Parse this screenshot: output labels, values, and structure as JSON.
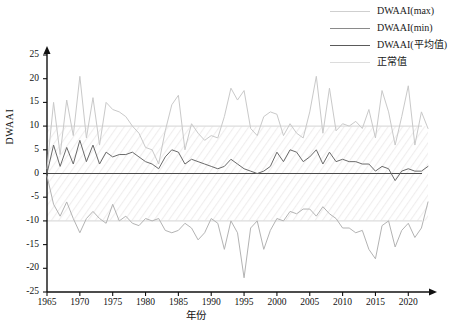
{
  "chart_data": {
    "type": "line",
    "title": "",
    "xlabel": "年份",
    "ylabel": "DWAAI",
    "xlim": [
      1965,
      2023
    ],
    "ylim": [
      -25,
      25
    ],
    "yticks": [
      25,
      20,
      15,
      10,
      5,
      0,
      -5,
      -10,
      -15,
      -20,
      -25
    ],
    "xticks": [
      1965,
      1970,
      1975,
      1980,
      1985,
      1990,
      1995,
      2000,
      2005,
      2010,
      2015,
      2020
    ],
    "grid": false,
    "legend_position": "top-right",
    "reference_lines": [
      {
        "label": "正常值",
        "value": 10,
        "color": "#dcdcdc"
      },
      {
        "label": "正常值",
        "value": -10,
        "color": "#dcdcdc"
      }
    ],
    "x": [
      1965,
      1966,
      1967,
      1968,
      1969,
      1970,
      1971,
      1972,
      1973,
      1974,
      1975,
      1976,
      1977,
      1978,
      1979,
      1980,
      1981,
      1982,
      1983,
      1984,
      1985,
      1986,
      1987,
      1988,
      1989,
      1990,
      1991,
      1992,
      1993,
      1994,
      1995,
      1996,
      1997,
      1998,
      1999,
      2000,
      2001,
      2002,
      2003,
      2004,
      2005,
      2006,
      2007,
      2008,
      2009,
      2010,
      2011,
      2012,
      2013,
      2014,
      2015,
      2016,
      2017,
      2018,
      2019,
      2020,
      2021,
      2022,
      2023
    ],
    "series": [
      {
        "name": "DWAAI(max)",
        "color": "#c9c9c9",
        "values": [
          1.0,
          15.0,
          4.0,
          15.5,
          8.0,
          20.5,
          7.5,
          16.0,
          6.0,
          15.0,
          13.5,
          13.0,
          12.0,
          10.0,
          8.5,
          5.5,
          5.0,
          2.0,
          9.0,
          14.5,
          16.5,
          5.0,
          10.5,
          8.5,
          7.0,
          8.0,
          7.5,
          12.0,
          18.0,
          15.5,
          17.5,
          9.5,
          8.0,
          12.0,
          13.0,
          12.5,
          8.0,
          10.5,
          8.5,
          7.5,
          13.0,
          20.5,
          8.5,
          18.0,
          9.0,
          10.5,
          10.0,
          11.0,
          9.5,
          13.5,
          7.5,
          17.5,
          13.0,
          6.0,
          12.0,
          18.5,
          6.0,
          13.0,
          9.5
        ]
      },
      {
        "name": "DWAAI(min)",
        "color": "#b3b3b3",
        "values": [
          -0.5,
          -6.5,
          -9.0,
          -6.0,
          -9.5,
          -12.5,
          -9.5,
          -8.0,
          -9.5,
          -10.5,
          -6.5,
          -10.0,
          -9.0,
          -10.5,
          -11.0,
          -9.5,
          -10.0,
          -9.5,
          -12.0,
          -12.5,
          -12.0,
          -10.5,
          -11.5,
          -14.0,
          -12.5,
          -9.5,
          -10.5,
          -16.0,
          -10.0,
          -12.5,
          -22.0,
          -11.5,
          -10.0,
          -16.0,
          -12.0,
          -9.5,
          -10.0,
          -8.0,
          -8.5,
          -7.5,
          -7.5,
          -9.0,
          -7.0,
          -8.5,
          -9.5,
          -11.5,
          -11.5,
          -12.5,
          -12.0,
          -16.0,
          -18.0,
          -11.0,
          -10.0,
          -15.5,
          -12.0,
          -10.5,
          -13.5,
          -11.5,
          -6.0
        ]
      },
      {
        "name": "DWAAI(平均值)",
        "color": "#6b6b6b",
        "values": [
          0.0,
          6.0,
          1.5,
          5.5,
          2.0,
          7.0,
          2.5,
          6.0,
          2.0,
          4.5,
          3.5,
          4.0,
          4.0,
          4.5,
          3.5,
          2.5,
          2.0,
          1.0,
          3.5,
          5.0,
          4.5,
          2.0,
          3.0,
          2.5,
          2.0,
          1.5,
          1.0,
          1.5,
          3.0,
          2.0,
          1.0,
          0.5,
          0.0,
          0.5,
          1.5,
          4.5,
          2.5,
          5.0,
          4.5,
          2.5,
          3.5,
          5.0,
          2.0,
          4.5,
          2.5,
          3.0,
          2.5,
          2.5,
          2.0,
          2.0,
          0.5,
          1.5,
          1.0,
          -1.5,
          0.5,
          1.0,
          0.5,
          0.5,
          1.5
        ]
      }
    ]
  },
  "legend": {
    "items": [
      {
        "label": "DWAAI(max)"
      },
      {
        "label": "DWAAI(min)"
      },
      {
        "label": "DWAAI(平均值)"
      },
      {
        "label": "正常值"
      }
    ]
  }
}
